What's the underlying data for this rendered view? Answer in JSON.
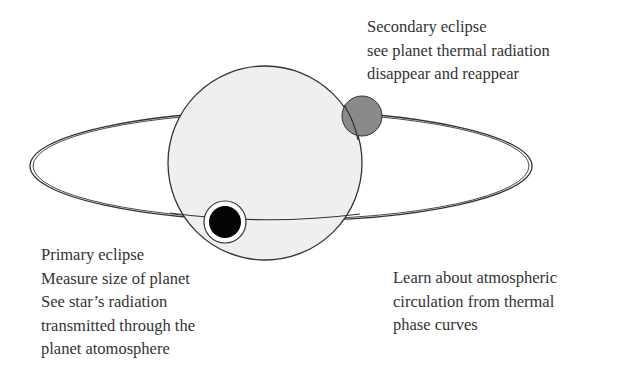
{
  "diagram": {
    "type": "transit-eclipse-geometry",
    "colors": {
      "star_fill": "#efefef",
      "stroke": "#333333",
      "secondary_planet_fill": "#8a8a8a",
      "primary_planet_fill": "#000000",
      "background": "#ffffff"
    },
    "elements": [
      "star",
      "orbit-ellipse",
      "secondary-eclipse-planet",
      "primary-eclipse-planet"
    ]
  },
  "labels": {
    "secondary": {
      "lines": [
        "Secondary eclipse",
        "see planet thermal radiation",
        "disappear and reappear"
      ]
    },
    "primary": {
      "lines": [
        "Primary eclipse",
        "Measure size of planet",
        "See star’s radiation",
        "transmitted through the",
        "planet atomosphere"
      ]
    },
    "phase": {
      "lines": [
        "Learn about atmospheric",
        "circulation from thermal",
        "phase curves"
      ]
    }
  }
}
